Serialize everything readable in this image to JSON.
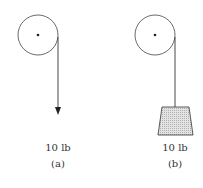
{
  "figure": {
    "panel_a": {
      "weight_label": "10 lb",
      "caption": "(a)"
    },
    "panel_b": {
      "weight_label": "10 lb",
      "caption": "(b)"
    }
  },
  "colors": {
    "line": "#333333",
    "block_fill": "#d9d9d9"
  }
}
